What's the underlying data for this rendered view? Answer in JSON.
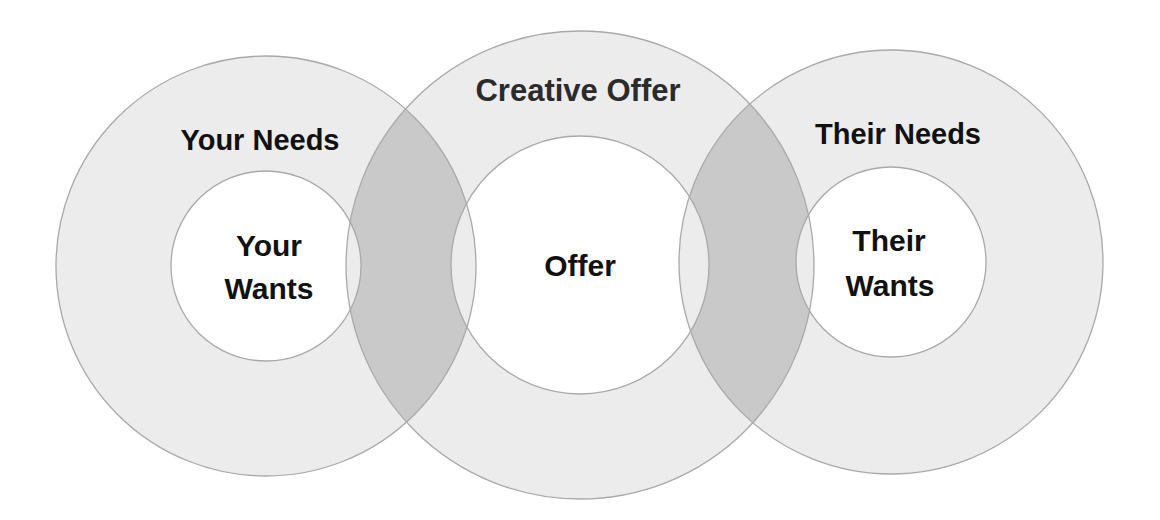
{
  "diagram": {
    "colors": {
      "background": "#ffffff",
      "ring_fill": "#ececec",
      "overlap_fill": "#c9c9c9",
      "inner_fill": "#ffffff",
      "stroke": "#a9a9a9",
      "text": "#111111"
    },
    "circles": [
      {
        "id": "yours",
        "outer_label": "Your Needs",
        "inner_label_line1": "Your",
        "inner_label_line2": "Wants",
        "cx": 266,
        "cy": 266,
        "outer_r": 210,
        "inner_r": 95
      },
      {
        "id": "offer",
        "outer_label": "Creative Offer",
        "inner_label_line1": "Offer",
        "cx": 580,
        "cy": 265,
        "outer_r": 234,
        "inner_r": 129
      },
      {
        "id": "theirs",
        "outer_label": "Their Needs",
        "inner_label_line1": "Their",
        "inner_label_line2": "Wants",
        "cx": 891,
        "cy": 262,
        "outer_r": 212,
        "inner_r": 95
      }
    ]
  }
}
